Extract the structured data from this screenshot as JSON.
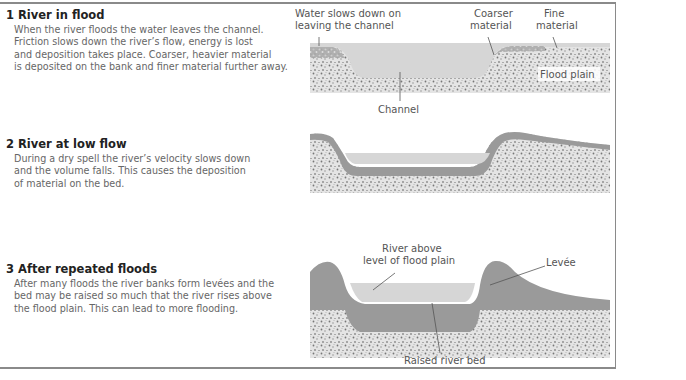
{
  "sections": [
    {
      "title": "1 River in flood",
      "lines": [
        "When the river floods the water leaves the channel.",
        "Friction slows down the river’s flow, energy is lost",
        "and deposition takes place. Coarser, heavier material",
        "is deposited on the bank and finer material further away."
      ]
    },
    {
      "title": "2 River at low flow",
      "lines": [
        "During a dry spell the river’s velocity slows down",
        "and the volume falls. This causes the deposition",
        "of material on the bed."
      ]
    },
    {
      "title": "3 After repeated floods",
      "lines": [
        "After many floods the river banks form levées and the",
        "bed may be raised so much that the river rises above",
        "the flood plain. This can lead to more flooding."
      ]
    }
  ],
  "diagram1": {
    "label_water_1": "Water slows down on",
    "label_water_2": "leaving the channel",
    "label_coarse_1": "Coarser",
    "label_coarse_2": "material",
    "label_fine_1": "Fine",
    "label_fine_2": "material",
    "label_floodplain": "Flood plain",
    "label_channel": "Channel"
  },
  "diagram3": {
    "label_river_1": "River above",
    "label_river_2": "level of flood plain",
    "label_levee": "Levée",
    "label_bed": "Raised river bed"
  },
  "colors": {
    "water": "#d6d6d6",
    "sediment": "#9a9a9a",
    "gravel_bg": "#e2e2e2",
    "border": "#8a8a8a"
  }
}
